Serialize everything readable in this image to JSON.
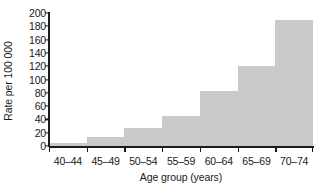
{
  "chart_data": {
    "type": "bar",
    "title": "",
    "subtitle": "",
    "xlabel": "Age group (years)",
    "ylabel": "Rate per 100 000",
    "categories": [
      "40–44",
      "45–49",
      "50–54",
      "55–59",
      "60–64",
      "65–69",
      "70–74"
    ],
    "values": [
      5,
      14,
      27,
      45,
      82,
      120,
      190
    ],
    "ylim": [
      0,
      200
    ],
    "yticks": [
      0,
      20,
      40,
      60,
      80,
      100,
      120,
      140,
      160,
      180,
      200
    ],
    "ytick_labels": [
      "0",
      "20",
      "40",
      "60",
      "80",
      "100",
      "120",
      "140",
      "160",
      "180",
      "200"
    ],
    "grid": false,
    "legend": null,
    "legend_position": "none",
    "bar_gap": 0,
    "series": [
      {
        "name": "Rate per 100 000",
        "values": [
          5,
          14,
          27,
          45,
          82,
          120,
          190
        ]
      }
    ],
    "annotations": []
  },
  "style": {
    "bar_color": "#c9c9c9",
    "axis_color": "#1a1a1a",
    "text_color": "#1a1a1a",
    "background": "#ffffff"
  }
}
